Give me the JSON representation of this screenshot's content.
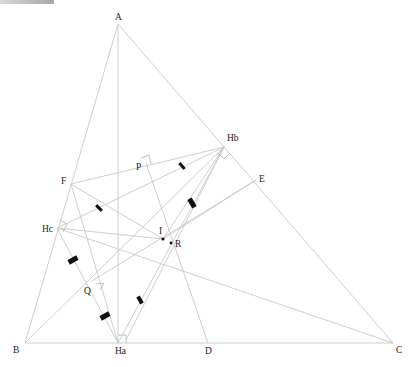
{
  "points": {
    "A": {
      "label": "A",
      "x": 118,
      "y": 24
    },
    "B": {
      "label": "B",
      "x": 25,
      "y": 343
    },
    "C": {
      "label": "C",
      "x": 393,
      "y": 343
    },
    "Ha": {
      "label": "Ha",
      "x": 118,
      "y": 343
    },
    "Hb": {
      "label": "Hb",
      "x": 224,
      "y": 147
    },
    "Hc": {
      "label": "Hc",
      "x": 57,
      "y": 228
    },
    "F": {
      "label": "F",
      "x": 71,
      "y": 184
    },
    "E": {
      "label": "E",
      "x": 256,
      "y": 180
    },
    "D": {
      "label": "D",
      "x": 208,
      "y": 343
    },
    "P": {
      "label": "P",
      "x": 146,
      "y": 163
    },
    "I": {
      "label": "I",
      "x": 163,
      "y": 239
    },
    "R": {
      "label": "R",
      "x": 171,
      "y": 243
    },
    "Q": {
      "label": "Q",
      "x": 92,
      "y": 281
    }
  },
  "labels": {
    "A": "A",
    "B": "B",
    "C": "C",
    "D": "D",
    "E": "E",
    "F": "F",
    "Ha": "Ha",
    "Hb": "Hb",
    "Hc": "Hc",
    "P": "P",
    "I": "I",
    "R": "R",
    "Q": "Q"
  },
  "style": {
    "line_color": "#c8c8c8",
    "tick_color": "#111111",
    "label_color": "#222222",
    "background": "#ffffff"
  }
}
